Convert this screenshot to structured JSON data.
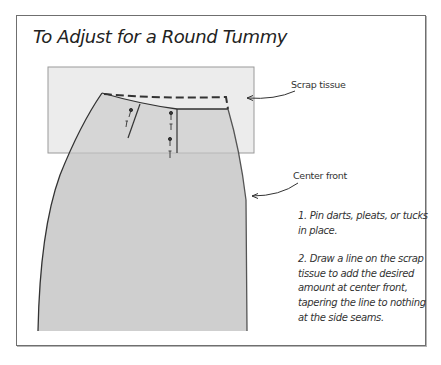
{
  "figure": {
    "title": "To Adjust for a Round Tummy",
    "callouts": [
      {
        "id": "scrap-tissue",
        "label": "Scrap tissue"
      },
      {
        "id": "center-front",
        "label": "Center front"
      }
    ],
    "steps": [
      {
        "number": "1.",
        "text": "1. Pin darts, pleats, or tucks in place."
      },
      {
        "number": "2.",
        "text": "2. Draw a line on the scrap tissue to add the desired amount at center front, tapering the line to nothing at the side seams."
      }
    ],
    "colors": {
      "frame_border": "#6f6f6f",
      "tissue_fill": "#ececec",
      "pattern_fill": "#cfcfcf",
      "line": "#333333"
    }
  }
}
